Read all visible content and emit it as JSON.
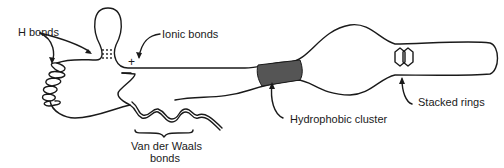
{
  "diagram": {
    "type": "protein tertiary structure interactions",
    "labels": {
      "h_bonds": "H bonds",
      "ionic_bonds": "Ionic bonds",
      "plus_charge": "+",
      "minus_charge": "−",
      "van_der_waals_line1": "Van der Waals",
      "van_der_waals_line2": "bonds",
      "hydrophobic_cluster": "Hydrophobic cluster",
      "stacked_rings": "Stacked rings"
    },
    "colors": {
      "line": "#1a1a1a",
      "hydrophobic_fill": "#555555",
      "background": "#ffffff"
    }
  }
}
